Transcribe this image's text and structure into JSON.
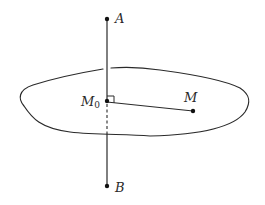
{
  "diagram": {
    "colors": {
      "stroke": "#2a2a2a",
      "background": "#ffffff"
    },
    "points": {
      "A": {
        "label": "A",
        "x": 107,
        "y": 19
      },
      "B": {
        "label": "B",
        "x": 107,
        "y": 186
      },
      "M0": {
        "label_main": "M",
        "label_sub": "0",
        "x": 107,
        "y": 101
      },
      "M": {
        "label": "M",
        "x": 193,
        "y": 111
      }
    },
    "elements": [
      {
        "type": "plane-outline",
        "label": ""
      },
      {
        "type": "line",
        "from": "A",
        "to": "B",
        "note": "dashed below the plane from M0"
      },
      {
        "type": "segment",
        "from": "M0",
        "to": "M"
      },
      {
        "type": "right-angle-mark",
        "at": "M0"
      }
    ]
  }
}
